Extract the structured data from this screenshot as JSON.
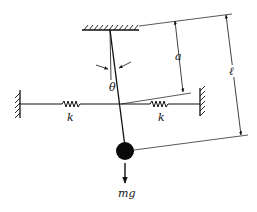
{
  "diagram": {
    "type": "pendulum-with-springs",
    "labels": {
      "angle": "θ",
      "pivot_to_spring_distance": "a",
      "pendulum_length": "ℓ",
      "spring_left": "k",
      "spring_right": "k",
      "weight": "mg"
    },
    "colors": {
      "ink": "#111111",
      "background": "#ffffff"
    }
  }
}
